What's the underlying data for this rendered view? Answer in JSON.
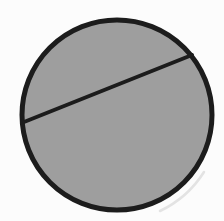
{
  "figure": {
    "kind": "geometry-diagram",
    "background_color": "#fcfcfc",
    "circle": {
      "cx": 117,
      "cy": 115,
      "r": 95,
      "fill": "#9e9e9e",
      "stroke": "#1c1c1c",
      "stroke_width": 5
    },
    "chord": {
      "x1": 24,
      "y1": 122,
      "x2": 192,
      "y2": 55,
      "stroke": "#1c1c1c",
      "stroke_width": 4,
      "linecap": "round"
    },
    "scan_shadow": {
      "path": "M 204 172 A 106 106 0 0 1 160 211",
      "stroke": "#dcdcdc",
      "stroke_width": 2.5,
      "opacity": 0.8
    }
  }
}
